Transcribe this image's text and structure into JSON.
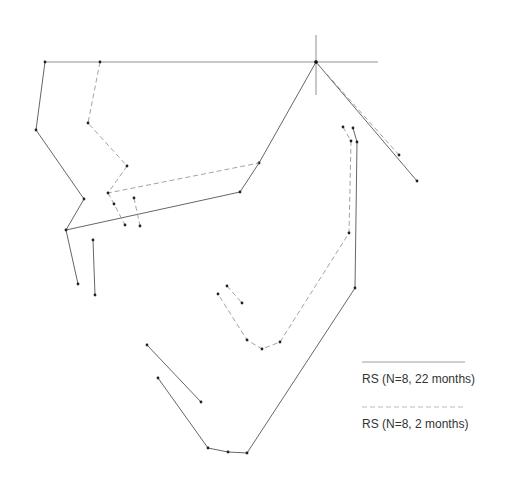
{
  "diagram": {
    "type": "cephalometric-superimposition",
    "reference": {
      "horizontal_line": [
        [
          45,
          62
        ],
        [
          378,
          62
        ]
      ],
      "crosshair_vertical": [
        [
          316,
          35
        ],
        [
          316,
          95
        ]
      ],
      "origin_point": [
        316,
        62
      ]
    },
    "series": [
      {
        "name": "RS (N=8, 22 months)",
        "style": "solid",
        "color": "#555555",
        "polylines": [
          [
            [
              45,
              62
            ],
            [
              36,
              130
            ],
            [
              84,
              199
            ],
            [
              66,
              230
            ],
            [
              78,
              284
            ]
          ],
          [
            [
              66,
              230
            ],
            [
              240,
              192
            ],
            [
              259,
              163
            ],
            [
              316,
              62
            ],
            [
              417,
              181
            ]
          ],
          [
            [
              93,
              240
            ],
            [
              95,
              295
            ]
          ],
          [
            [
              353,
              128
            ],
            [
              357,
              142
            ],
            [
              355,
              288
            ],
            [
              247,
              453
            ],
            [
              228,
              452
            ],
            [
              208,
              448
            ],
            [
              158,
              378
            ]
          ],
          [
            [
              147,
              345
            ],
            [
              201,
              402
            ]
          ]
        ],
        "points": [
          [
            45,
            62
          ],
          [
            36,
            130
          ],
          [
            84,
            199
          ],
          [
            66,
            230
          ],
          [
            78,
            284
          ],
          [
            240,
            192
          ],
          [
            259,
            163
          ],
          [
            316,
            62
          ],
          [
            417,
            181
          ],
          [
            93,
            240
          ],
          [
            95,
            295
          ],
          [
            353,
            128
          ],
          [
            357,
            142
          ],
          [
            355,
            288
          ],
          [
            247,
            453
          ],
          [
            228,
            452
          ],
          [
            208,
            448
          ],
          [
            158,
            378
          ],
          [
            147,
            345
          ],
          [
            201,
            402
          ]
        ]
      },
      {
        "name": "RS (N=8, 2 months)",
        "style": "dashed",
        "color": "#999999",
        "polylines": [
          [
            [
              100,
              62
            ],
            [
              88,
              123
            ],
            [
              127,
              166
            ],
            [
              108,
              193
            ],
            [
              259,
              163
            ]
          ],
          [
            [
              108,
              193
            ],
            [
              114,
              204
            ],
            [
              125,
              225
            ]
          ],
          [
            [
              134,
              198
            ],
            [
              140,
              226
            ]
          ],
          [
            [
              316,
              62
            ],
            [
              399,
              155
            ]
          ],
          [
            [
              343,
              127
            ],
            [
              351,
              141
            ],
            [
              349,
              233
            ],
            [
              280,
              342
            ],
            [
              262,
              349
            ],
            [
              247,
              340
            ],
            [
              218,
              294
            ]
          ],
          [
            [
              227,
              286
            ],
            [
              242,
              303
            ]
          ]
        ],
        "points": [
          [
            100,
            62
          ],
          [
            88,
            123
          ],
          [
            127,
            166
          ],
          [
            108,
            193
          ],
          [
            114,
            204
          ],
          [
            125,
            225
          ],
          [
            134,
            198
          ],
          [
            140,
            226
          ],
          [
            399,
            155
          ],
          [
            343,
            127
          ],
          [
            351,
            141
          ],
          [
            349,
            233
          ],
          [
            280,
            342
          ],
          [
            262,
            349
          ],
          [
            247,
            340
          ],
          [
            218,
            294
          ],
          [
            227,
            286
          ],
          [
            242,
            303
          ]
        ]
      }
    ]
  },
  "legend": {
    "items": [
      {
        "label": "RS (N=8, 22 months)",
        "style": "solid",
        "line": [
          [
            362,
            362
          ],
          [
            465,
            362
          ]
        ],
        "label_pos": [
          362,
          372
        ]
      },
      {
        "label": "RS (N=8, 2 months)",
        "style": "dashed",
        "line": [
          [
            362,
            407
          ],
          [
            465,
            407
          ]
        ],
        "label_pos": [
          362,
          417
        ]
      }
    ]
  }
}
